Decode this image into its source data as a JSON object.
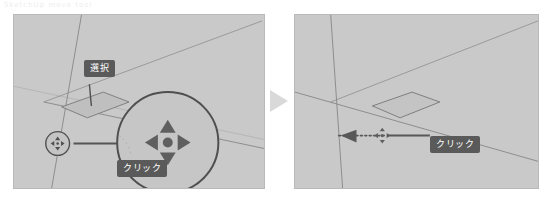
{
  "page": {
    "width": 544,
    "height": 201,
    "background": "#ffffff",
    "top_caption": "SketchUp  move tool"
  },
  "colors": {
    "panel_fill": "#c9c9c9",
    "panel_border": "#b9b9b9",
    "scene_line": "#8a8a8a",
    "scene_line_faint": "#a6a6a6",
    "badge_bg": "#5a5a5a",
    "badge_text": "#ffffff",
    "cursor_dark": "#5f5f5f",
    "separator_triangle": "#d8d8d8",
    "callout_line": "#6a6a6a"
  },
  "separator": {
    "icon": "play-triangle-icon",
    "label": "next-step-arrow"
  },
  "panels": [
    {
      "id": "before",
      "name": "step-before",
      "scene": {
        "axis_lines": [
          "vertical-axis",
          "red-axis",
          "green-axis"
        ],
        "face": {
          "name": "selected-face",
          "state": "selected"
        }
      },
      "magnifier": {
        "name": "magnifier-circle",
        "contents": "move-cursor-icon",
        "source_marker": "small-cursor-circle"
      },
      "badges": [
        {
          "id": "select",
          "name": "callout-select",
          "text": "選択"
        },
        {
          "id": "click",
          "name": "callout-click",
          "text": "クリック"
        }
      ]
    },
    {
      "id": "after",
      "name": "step-after",
      "scene": {
        "axis_lines": [
          "vertical-axis",
          "red-axis",
          "green-axis"
        ],
        "face": {
          "name": "moved-face",
          "state": "deselected"
        }
      },
      "motion": {
        "name": "drag-direction-arrow",
        "style": "dotted",
        "direction": "left"
      },
      "cursor": {
        "name": "move-cursor-icon"
      },
      "badges": [
        {
          "id": "click",
          "name": "callout-click",
          "text": "クリック"
        }
      ]
    }
  ]
}
